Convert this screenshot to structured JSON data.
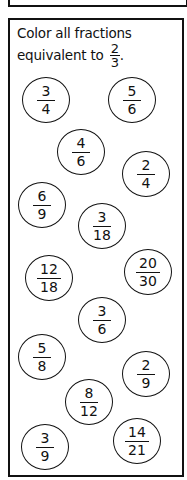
{
  "instruction": {
    "text": "Color all fractions equivalent to",
    "line1": "Color all fractions",
    "line2": "equivalent to",
    "target": {
      "num": "2",
      "den": "3"
    },
    "end": "."
  },
  "fractions": [
    {
      "num": "3",
      "den": "4",
      "cx": 46,
      "cy": 100
    },
    {
      "num": "5",
      "den": "6",
      "cx": 132,
      "cy": 100
    },
    {
      "num": "4",
      "den": "6",
      "cx": 81,
      "cy": 152
    },
    {
      "num": "2",
      "den": "4",
      "cx": 146,
      "cy": 174
    },
    {
      "num": "6",
      "den": "9",
      "cx": 42,
      "cy": 205
    },
    {
      "num": "3",
      "den": "18",
      "cx": 102,
      "cy": 226
    },
    {
      "num": "12",
      "den": "18",
      "cx": 49,
      "cy": 278
    },
    {
      "num": "20",
      "den": "30",
      "cx": 148,
      "cy": 272
    },
    {
      "num": "3",
      "den": "6",
      "cx": 102,
      "cy": 320
    },
    {
      "num": "5",
      "den": "8",
      "cx": 42,
      "cy": 357
    },
    {
      "num": "2",
      "den": "9",
      "cx": 146,
      "cy": 374
    },
    {
      "num": "8",
      "den": "12",
      "cx": 89,
      "cy": 402
    },
    {
      "num": "3",
      "den": "9",
      "cx": 45,
      "cy": 447
    },
    {
      "num": "14",
      "den": "21",
      "cx": 137,
      "cy": 441
    }
  ]
}
